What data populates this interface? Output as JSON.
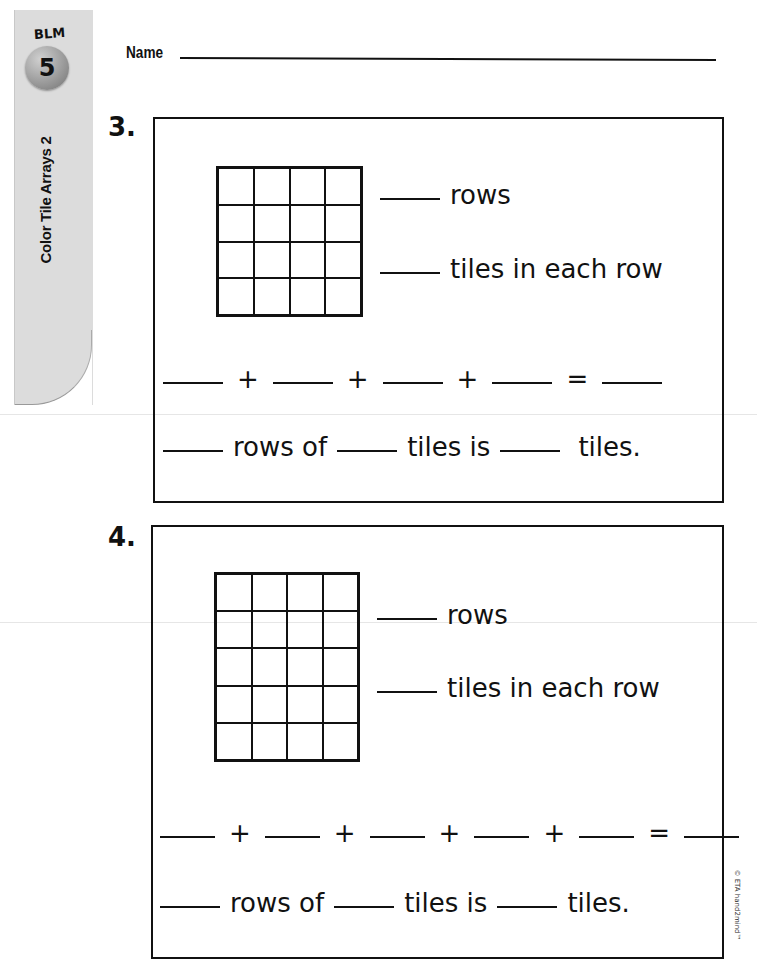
{
  "sidebar_tab": {
    "blm_label": "BLM",
    "blm_number": "5",
    "title": "Color Tile Arrays 2"
  },
  "header": {
    "name_label": "Name"
  },
  "problems": [
    {
      "number": "3.",
      "grid": {
        "rows": 4,
        "cols": 4
      },
      "rows_text": "rows",
      "tiles_text": "tiles in each row",
      "addition": {
        "blanks": 4,
        "plus": "+",
        "equals": "="
      },
      "sentence": {
        "part1": "rows of",
        "part2": "tiles is",
        "part3": "tiles."
      }
    },
    {
      "number": "4.",
      "grid": {
        "rows": 5,
        "cols": 4
      },
      "rows_text": "rows",
      "tiles_text": "tiles in each row",
      "addition": {
        "blanks": 5,
        "plus": "+",
        "equals": "="
      },
      "sentence": {
        "part1": "rows of",
        "part2": "tiles is",
        "part3": "tiles."
      }
    }
  ],
  "footer": {
    "copyright": "© ETA hand2mind™"
  }
}
